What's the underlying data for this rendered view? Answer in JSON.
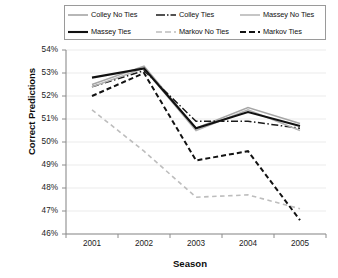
{
  "chart_data": {
    "type": "line",
    "title": "",
    "xlabel": "Season",
    "ylabel": "Correct Predictions",
    "categories": [
      "2001",
      "2002",
      "2003",
      "2004",
      "2005"
    ],
    "x": [
      2001,
      2002,
      2003,
      2004,
      2005
    ],
    "ylim": [
      46,
      54
    ],
    "yticks": [
      "46%",
      "47%",
      "48%",
      "49%",
      "50%",
      "51%",
      "52%",
      "53%",
      "54%"
    ],
    "ytick_values": [
      46,
      47,
      48,
      49,
      50,
      51,
      52,
      53,
      54
    ],
    "grid": true,
    "legend_position": "top",
    "units": "percent",
    "series": [
      {
        "name": "Colley No Ties",
        "values": [
          52.5,
          53.3,
          50.6,
          51.5,
          50.8
        ],
        "color": "#a6a6a6",
        "style": "solid",
        "width": 1.6
      },
      {
        "name": "Colley Ties",
        "values": [
          52.4,
          53.1,
          50.9,
          50.9,
          50.6
        ],
        "color": "#1a1a1a",
        "style": "dashdot",
        "width": 1.5
      },
      {
        "name": "Massey No Ties",
        "values": [
          52.4,
          53.2,
          50.5,
          51.4,
          50.5
        ],
        "color": "#b3b3b3",
        "style": "solid",
        "width": 1.5
      },
      {
        "name": "Massey Ties",
        "values": [
          52.8,
          53.2,
          50.6,
          51.3,
          50.7
        ],
        "color": "#111111",
        "style": "solid",
        "width": 2.1
      },
      {
        "name": "Markov No Ties",
        "values": [
          51.4,
          49.6,
          47.6,
          47.7,
          47.1
        ],
        "color": "#bdbdbd",
        "style": "dashed",
        "width": 1.6
      },
      {
        "name": "Markov Ties",
        "values": [
          52.0,
          53.0,
          49.2,
          49.6,
          46.6
        ],
        "color": "#121212",
        "style": "dashed",
        "width": 2.0
      }
    ]
  },
  "legend": {
    "entries": [
      {
        "label": "Colley No Ties"
      },
      {
        "label": "Colley Ties"
      },
      {
        "label": "Massey No Ties"
      },
      {
        "label": "Massey Ties"
      },
      {
        "label": "Markov No Ties"
      },
      {
        "label": "Markov Ties"
      }
    ]
  }
}
